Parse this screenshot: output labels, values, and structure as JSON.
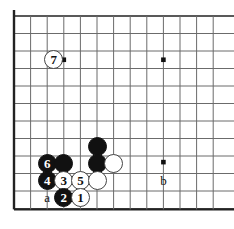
{
  "figure": {
    "type": "go-board-diagram",
    "name": "go-joseki-diagram",
    "board": {
      "cols": 13,
      "rows": 12,
      "left_px": 14,
      "top_px": 16,
      "step_px": 16.6,
      "row_step_px": 17.5,
      "edge_color": "#222222",
      "line_color": "#6b6b6b",
      "background_color": "#ffffff",
      "left_edge": true,
      "bottom_edge": true,
      "top_edge": true,
      "right_edge": false
    },
    "star_points": [
      {
        "name": "star-point-top-left",
        "col": 3,
        "row": 2.5
      },
      {
        "name": "star-point-top-right",
        "col": 9,
        "row": 2.5
      },
      {
        "name": "star-point-bottom-right",
        "col": 9,
        "row": 8.35
      }
    ],
    "stones": [
      {
        "id": "stone-7-white",
        "color": "white",
        "label": "7",
        "col": 2.4,
        "row": 2.5
      },
      {
        "id": "stone-black-upper",
        "color": "black",
        "label": "",
        "col": 5,
        "row": 7.45
      },
      {
        "id": "stone-black-mid",
        "color": "black",
        "label": "",
        "col": 5,
        "row": 8.42
      },
      {
        "id": "stone-white-right",
        "color": "white",
        "label": "",
        "col": 6,
        "row": 8.42
      },
      {
        "id": "stone-6-black",
        "color": "black",
        "label": "6",
        "col": 2,
        "row": 8.42
      },
      {
        "id": "stone-black-left-upper",
        "color": "black",
        "label": "",
        "col": 3,
        "row": 8.42
      },
      {
        "id": "stone-4-black",
        "color": "black",
        "label": "4",
        "col": 2,
        "row": 9.4
      },
      {
        "id": "stone-3-white",
        "color": "white",
        "label": "3",
        "col": 3,
        "row": 9.4
      },
      {
        "id": "stone-5-white",
        "color": "white",
        "label": "5",
        "col": 4,
        "row": 9.4
      },
      {
        "id": "stone-white-lower",
        "color": "white",
        "label": "",
        "col": 5,
        "row": 9.4
      },
      {
        "id": "stone-2-black",
        "color": "black",
        "label": "2",
        "col": 3,
        "row": 10.38
      },
      {
        "id": "stone-1-white",
        "color": "white",
        "label": "1",
        "col": 4,
        "row": 10.38
      }
    ],
    "point_labels": [
      {
        "id": "label-a",
        "text": "a",
        "col": 2,
        "row": 10.38
      },
      {
        "id": "label-b",
        "text": "b",
        "col": 9,
        "row": 9.4
      }
    ]
  }
}
